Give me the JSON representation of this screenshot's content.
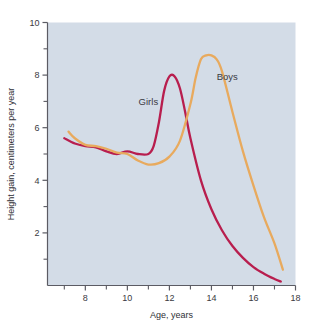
{
  "chart_data": {
    "type": "line",
    "title": "",
    "subtitle": "",
    "xlabel": "Age, years",
    "ylabel": "Height gain, centimeters per year",
    "xlim": [
      6.2,
      18
    ],
    "ylim": [
      0,
      10
    ],
    "xticks": [
      8,
      10,
      12,
      14,
      16,
      18
    ],
    "xtick_labels": [
      "8",
      "10",
      "12",
      "14",
      "16",
      "18"
    ],
    "xminor_ticks": [
      7,
      9,
      11,
      13,
      15,
      17
    ],
    "yticks": [
      2,
      4,
      6,
      8,
      10
    ],
    "ytick_labels": [
      "2",
      "4",
      "6",
      "8",
      "10"
    ],
    "yminor_ticks": [
      1,
      3,
      5,
      7,
      9
    ],
    "grid": false,
    "legend_position": "inline-annotations",
    "plot_background": "#d3dce7",
    "series": [
      {
        "name": "Girls",
        "color": "#b81e4e",
        "label_x": 11.0,
        "label_y": 6.85,
        "x": [
          7.0,
          7.5,
          8.0,
          8.5,
          9.0,
          9.5,
          10.0,
          10.5,
          11.0,
          11.25,
          11.5,
          11.75,
          12.0,
          12.25,
          12.5,
          12.75,
          13.0,
          13.5,
          14.0,
          14.5,
          15.0,
          15.5,
          16.0,
          16.5,
          17.0,
          17.3
        ],
        "y": [
          5.6,
          5.4,
          5.3,
          5.25,
          5.1,
          5.0,
          5.1,
          5.0,
          5.0,
          5.3,
          6.2,
          7.4,
          7.95,
          7.95,
          7.5,
          6.6,
          5.6,
          4.0,
          2.9,
          2.1,
          1.5,
          1.05,
          0.7,
          0.45,
          0.25,
          0.15
        ]
      },
      {
        "name": "Boys",
        "color": "#e8aa5e",
        "label_x": 14.75,
        "label_y": 7.8,
        "x": [
          7.2,
          7.5,
          8.0,
          8.5,
          9.0,
          9.5,
          10.0,
          10.5,
          11.0,
          11.5,
          12.0,
          12.5,
          13.0,
          13.25,
          13.5,
          13.75,
          14.0,
          14.25,
          14.5,
          15.0,
          15.5,
          16.0,
          16.5,
          17.0,
          17.4
        ],
        "y": [
          5.85,
          5.6,
          5.35,
          5.3,
          5.2,
          5.05,
          5.0,
          4.75,
          4.6,
          4.65,
          4.9,
          5.5,
          6.9,
          7.9,
          8.6,
          8.75,
          8.75,
          8.6,
          8.15,
          6.6,
          5.1,
          3.8,
          2.6,
          1.6,
          0.6
        ]
      }
    ],
    "annotations": [
      {
        "text": "Girls",
        "x": 11.0,
        "y": 6.85
      },
      {
        "text": "Boys",
        "x": 14.75,
        "y": 7.8
      }
    ]
  },
  "colors": {
    "girls": "#b81e4e",
    "boys": "#e8aa5e",
    "plot_bg": "#d3dce7",
    "axis": "#5b5b63",
    "text": "#3a3a42",
    "page_bg": "#ffffff"
  }
}
